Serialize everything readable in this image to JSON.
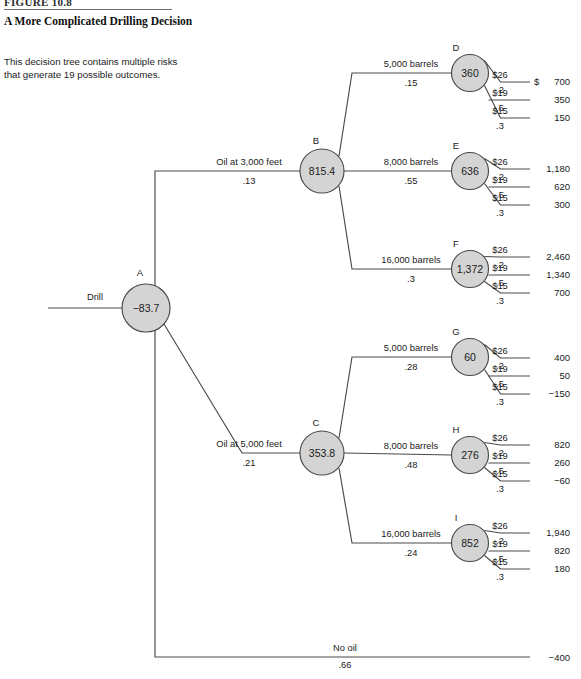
{
  "figure": {
    "label": "FIGURE 10.8",
    "title": "A More Complicated Drilling Decision",
    "caption": "This decision tree contains multiple risks that generate 19 possible outcomes."
  },
  "chart_data": {
    "type": "diagram",
    "diagram_type": "decision-tree",
    "title": "A More Complicated Drilling Decision",
    "root": {
      "id": "A",
      "value": "−83.7",
      "decision_label": "Drill"
    },
    "price_branches": [
      {
        "price": "$26",
        "prob": ".2"
      },
      {
        "price": "$19",
        "prob": ".5"
      },
      {
        "price": "$15",
        "prob": ".3"
      }
    ],
    "dollar_sign": "$",
    "nodes": [
      {
        "id": "B",
        "value": "815.4",
        "branch": "Oil at 3,000 feet",
        "prob": ".13",
        "children": [
          {
            "id": "D",
            "value": "360",
            "branch": "5,000 barrels",
            "prob": ".15",
            "payoffs": [
              "700",
              "350",
              "150"
            ]
          },
          {
            "id": "E",
            "value": "636",
            "branch": "8,000 barrels",
            "prob": ".55",
            "payoffs": [
              "1,180",
              "620",
              "300"
            ]
          },
          {
            "id": "F",
            "value": "1,372",
            "branch": "16,000 barrels",
            "prob": ".3",
            "payoffs": [
              "2,460",
              "1,340",
              "700"
            ]
          }
        ]
      },
      {
        "id": "C",
        "value": "353.8",
        "branch": "Oil at 5,000 feet",
        "prob": ".21",
        "children": [
          {
            "id": "G",
            "value": "60",
            "branch": "5,000 barrels",
            "prob": ".28",
            "payoffs": [
              "400",
              "50",
              "−150"
            ]
          },
          {
            "id": "H",
            "value": "276",
            "branch": "8,000 barrels",
            "prob": ".48",
            "payoffs": [
              "820",
              "260",
              "−60"
            ]
          },
          {
            "id": "I",
            "value": "852",
            "branch": "16,000 barrels",
            "prob": ".24",
            "payoffs": [
              "1,940",
              "820",
              "180"
            ]
          }
        ]
      }
    ],
    "no_oil": {
      "branch": "No oil",
      "prob": ".66",
      "payoff": "−400"
    },
    "colors": {
      "node_fill": "#d4d4d4",
      "line": "#4a4a4a",
      "text": "#1a1a1a"
    }
  }
}
